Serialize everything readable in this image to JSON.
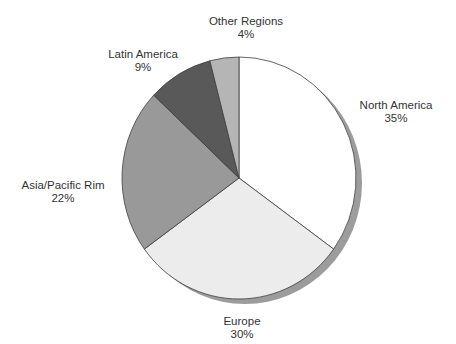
{
  "chart_data": {
    "type": "pie",
    "title": "",
    "legend": "none",
    "labels_position": "outside",
    "start_angle_deg": 0,
    "direction": "clockwise",
    "background": "#ffffff",
    "outline_color": "#3e3e3e",
    "shadow_color": "#9c9c9c",
    "slices": [
      {
        "label": "North America",
        "value": 35,
        "display": "35%",
        "color": "#ffffff"
      },
      {
        "label": "Europe",
        "value": 30,
        "display": "30%",
        "color": "#ececec"
      },
      {
        "label": "Asia/Pacific Rim",
        "value": 22,
        "display": "22%",
        "color": "#999999"
      },
      {
        "label": "Latin America",
        "value": 9,
        "display": "9%",
        "color": "#595959"
      },
      {
        "label": "Other Regions",
        "value": 4,
        "display": "4%",
        "color": "#b5b5b5"
      }
    ]
  }
}
